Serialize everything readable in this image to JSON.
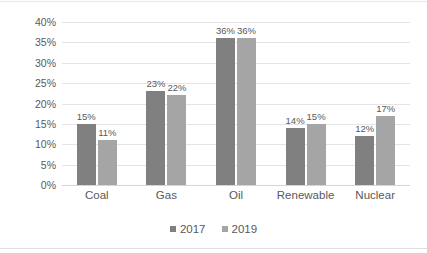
{
  "chart_data": {
    "type": "bar",
    "title": "",
    "subtitle": "",
    "xlabel": "",
    "ylabel": "",
    "categories": [
      "Coal",
      "Gas",
      "Oil",
      "Renewable",
      "Nuclear"
    ],
    "series": [
      {
        "name": "2017",
        "color": "#808080",
        "values": [
          15,
          23,
          36,
          14,
          12
        ],
        "labels": [
          "15%",
          "23%",
          "36%",
          "14%",
          "12%"
        ]
      },
      {
        "name": "2019",
        "color": "#a5a5a5",
        "values": [
          11,
          22,
          36,
          15,
          17
        ],
        "labels": [
          "11%",
          "22%",
          "36%",
          "15%",
          "17%"
        ]
      }
    ],
    "ylim": [
      0,
      40
    ],
    "ytick_values": [
      0,
      5,
      10,
      15,
      20,
      25,
      30,
      35,
      40
    ],
    "ytick_labels": [
      "0%",
      "5%",
      "10%",
      "15%",
      "20%",
      "25%",
      "30%",
      "35%",
      "40%"
    ],
    "grid": "horizontal",
    "legend_position": "bottom",
    "data_labels": true
  },
  "legend": {
    "items": [
      {
        "label": "2017",
        "color": "#808080"
      },
      {
        "label": "2019",
        "color": "#a5a5a5"
      }
    ]
  },
  "colors": {
    "series_2017": "#808080",
    "series_2019": "#a5a5a5",
    "gridline": "#e4e4e6",
    "axis_text": "#58595b",
    "background": "#ffffff"
  }
}
